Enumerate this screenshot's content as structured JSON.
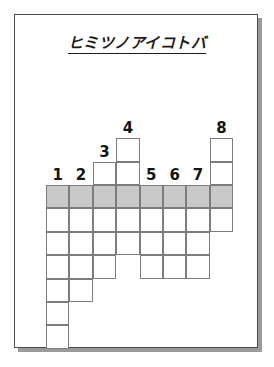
{
  "worksheet": {
    "title": "ヒミツノアイコトバ",
    "page_label": "puzzle-sheet"
  },
  "grid": {
    "columns": 8,
    "cell_size": 23.4,
    "origin_x": 45,
    "origin_y": 184,
    "shaded_row_index": 0,
    "shaded_color": "#c9c9c9",
    "cell_border_color": "#7d7d7d",
    "column_numbers": [
      "1",
      "2",
      "3",
      "4",
      "5",
      "6",
      "7",
      "8"
    ],
    "columns_detail": [
      {
        "number": "1",
        "cells_above_shaded": 0,
        "cells_below_shaded": 6
      },
      {
        "number": "2",
        "cells_above_shaded": 0,
        "cells_below_shaded": 4
      },
      {
        "number": "3",
        "cells_above_shaded": 1,
        "cells_below_shaded": 3
      },
      {
        "number": "4",
        "cells_above_shaded": 2,
        "cells_below_shaded": 2
      },
      {
        "number": "5",
        "cells_above_shaded": 0,
        "cells_below_shaded": 3
      },
      {
        "number": "6",
        "cells_above_shaded": 0,
        "cells_below_shaded": 3
      },
      {
        "number": "7",
        "cells_above_shaded": 0,
        "cells_below_shaded": 3
      },
      {
        "number": "8",
        "cells_above_shaded": 2,
        "cells_below_shaded": 1
      }
    ]
  }
}
